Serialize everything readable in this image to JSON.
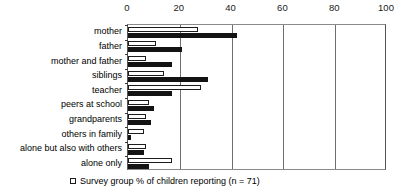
{
  "chart_data": {
    "type": "bar",
    "orientation": "horizontal",
    "title": "",
    "xlabel": "",
    "ylabel": "",
    "xlim": [
      0,
      100
    ],
    "xticks": [
      0,
      20,
      40,
      60,
      80,
      100
    ],
    "tick_labels": [
      "0",
      "20",
      "40",
      "60",
      "80",
      "100"
    ],
    "grid": true,
    "gridlines_at": [
      20,
      40,
      60,
      80
    ],
    "legend_position": "bottom-left",
    "categories": [
      "mother",
      "father",
      "mother and father",
      "siblings",
      "teacher",
      "peers at school",
      "grandparents",
      "others in family",
      "alone but also with others",
      "alone only"
    ],
    "series": [
      {
        "name": "Survey group % of children reporting (n = 71)",
        "style": "open",
        "color": "#ffffff",
        "edge_color": "#1c1c1c",
        "values": [
          27,
          11,
          7,
          14,
          28,
          8,
          7,
          6,
          7,
          17
        ]
      },
      {
        "name": "Comparison group % of children reporting",
        "style": "filled",
        "color": "#131313",
        "edge_color": "#131313",
        "values": [
          42,
          21,
          17,
          31,
          17,
          10,
          9,
          1,
          6,
          8
        ]
      }
    ]
  },
  "legend": {
    "entries": [
      {
        "swatch": "open-square",
        "label": "Survey group % of children reporting (n = 71)"
      }
    ]
  }
}
